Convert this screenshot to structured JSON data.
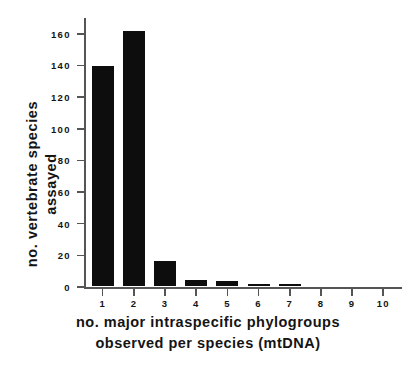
{
  "chart_data": {
    "type": "bar",
    "title": "",
    "subtitle": "",
    "xlabel": "no. major intraspecific phylogroups observed per species (mtDNA)",
    "xlabel_lines": [
      "no.  major  intraspecific  phylogroups",
      "observed  per  species  (mtDNA)"
    ],
    "ylabel": "no. vertebrate species assayed",
    "ylabel_lines": [
      "no.  vertebrate  species",
      "assayed"
    ],
    "categories": [
      "1",
      "2",
      "3",
      "4",
      "5",
      "6",
      "7",
      "8",
      "9",
      "10"
    ],
    "values": [
      139,
      161,
      16,
      4,
      3,
      1,
      1,
      0,
      0,
      0
    ],
    "ylim": [
      0,
      170
    ],
    "xlim": [
      0.4,
      10.6
    ],
    "yticks": [
      0,
      20,
      40,
      60,
      80,
      100,
      120,
      140,
      160
    ],
    "ytick_labels": [
      "0",
      "20",
      "40",
      "60",
      "80",
      "100",
      "120",
      "140",
      "160"
    ],
    "xticks": [
      "1",
      "2",
      "3",
      "4",
      "5",
      "6",
      "7",
      "8",
      "9",
      "10"
    ],
    "grid": false,
    "legend": "none",
    "bar_color": "#0d0d0d",
    "axis_color": "#555555",
    "background": "#ffffff",
    "text_color": "#141414"
  }
}
